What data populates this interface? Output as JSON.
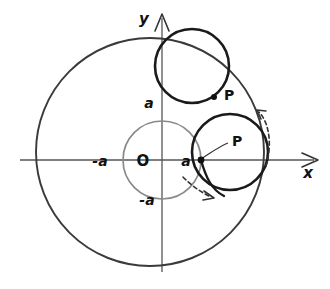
{
  "figure": {
    "background_color": "#ffffff",
    "ink_color": "#1a1a1a",
    "axis_color": "#555555",
    "base_circle_color": "#8a8a8a",
    "curve_color": "#3a3a3a",
    "dashed_color": "#333333"
  },
  "axes": {
    "x_label": "x",
    "y_label": "y",
    "origin_label": "O",
    "x_axis_y": 160,
    "y_axis_x": 162,
    "x_arrow_tip_x": 316,
    "y_arrow_tip_y": 14
  },
  "tick_labels": {
    "x_positive": "a",
    "x_negative": "-a",
    "y_positive": "a",
    "y_negative": "-a"
  },
  "points": [
    {
      "label": "P",
      "position": "upper",
      "x": 224,
      "y": 95,
      "dot_x": 214,
      "dot_y": 97
    },
    {
      "label": "P",
      "position": "right",
      "x": 232,
      "y": 140,
      "dot_x": 200,
      "dot_y": 160
    }
  ],
  "circles": {
    "outer_cardioid": {
      "cx": 150,
      "cy": 152,
      "r": 114,
      "stroke": "#3a3a3a",
      "width": 1.9
    },
    "base_circle": {
      "cx": 162,
      "cy": 160,
      "r": 39,
      "stroke": "#8a8a8a",
      "width": 1.7
    },
    "rolling_upper": {
      "cx": 192,
      "cy": 66,
      "r": 37,
      "stroke": "#1a1a1a",
      "width": 2.6
    },
    "rolling_right": {
      "cx": 230,
      "cy": 152,
      "r": 38,
      "stroke": "#1a1a1a",
      "width": 2.6
    }
  },
  "arrows": {
    "rotation_arrow": {
      "name": "counterclockwise-rotation-arrow",
      "dashed": true
    },
    "roll_arrow": {
      "name": "rolling-direction-arrow",
      "dashed": true
    }
  },
  "leader_line": {
    "from_x": 202,
    "from_y": 158,
    "to_x": 228,
    "to_y": 143
  }
}
